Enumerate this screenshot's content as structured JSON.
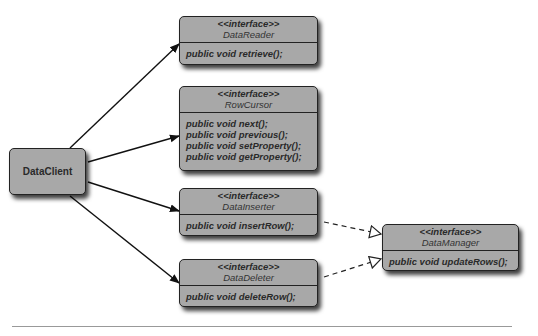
{
  "client": {
    "name": "DataClient"
  },
  "interfaces": [
    {
      "stereotype": "<<interface>>",
      "name": "DataReader",
      "methods": [
        "public void retrieve();"
      ]
    },
    {
      "stereotype": "<<interface>>",
      "name": "RowCursor",
      "methods": [
        "public void next();",
        "public void previous();",
        "public void setProperty();",
        "public void getProperty();"
      ]
    },
    {
      "stereotype": "<<interface>>",
      "name": "DataInserter",
      "methods": [
        "public void insertRow();"
      ]
    },
    {
      "stereotype": "<<interface>>",
      "name": "DataDeleter",
      "methods": [
        "public void deleteRow();"
      ]
    },
    {
      "stereotype": "<<interface>>",
      "name": "DataManager",
      "methods": [
        "public void updateRows();"
      ]
    }
  ],
  "relations": [
    {
      "from": "DataClient",
      "to": "DataReader",
      "type": "association"
    },
    {
      "from": "DataClient",
      "to": "RowCursor",
      "type": "association"
    },
    {
      "from": "DataClient",
      "to": "DataInserter",
      "type": "association"
    },
    {
      "from": "DataClient",
      "to": "DataDeleter",
      "type": "association"
    },
    {
      "from": "DataInserter",
      "to": "DataManager",
      "type": "realization"
    },
    {
      "from": "DataDeleter",
      "to": "DataManager",
      "type": "realization"
    }
  ]
}
